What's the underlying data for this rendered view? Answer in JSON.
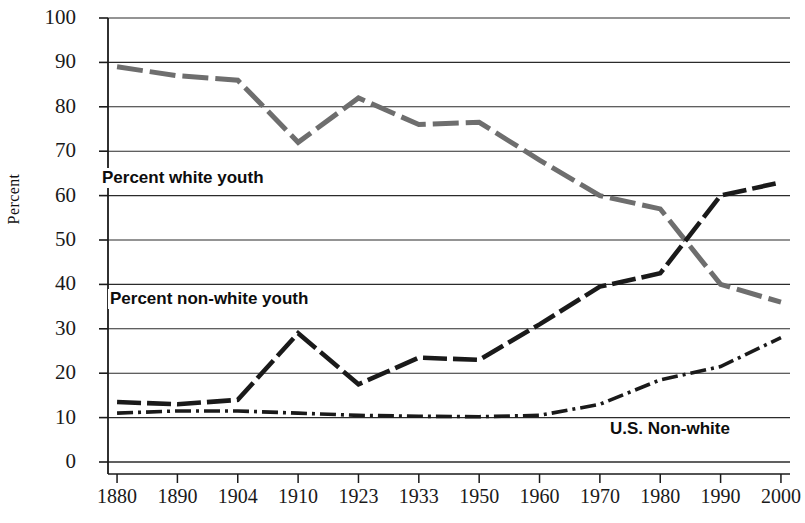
{
  "chart_data": {
    "type": "line",
    "title": "",
    "xlabel": "",
    "ylabel": "Percent",
    "ylim": [
      0,
      100
    ],
    "ytick_step": 10,
    "grid": true,
    "legend_position": "inline-annotations",
    "categories": [
      "1880",
      "1890",
      "1904",
      "1910",
      "1923",
      "1933",
      "1950",
      "1960",
      "1970",
      "1980",
      "1990",
      "2000"
    ],
    "series": [
      {
        "name": "Percent white youth",
        "color": "#6e6e6e",
        "style": "long-dash",
        "values": [
          89,
          87,
          86,
          72,
          82,
          76,
          76.5,
          68,
          60,
          57,
          40,
          36
        ]
      },
      {
        "name": "Percent non-white youth",
        "color": "#1a1a1a",
        "style": "dashed-thick",
        "values": [
          13.5,
          13,
          14,
          29,
          17.5,
          23.5,
          23,
          31,
          39.5,
          42.5,
          60,
          63
        ]
      },
      {
        "name": "U.S. Non-white",
        "color": "#1a1a1a",
        "style": "dash-dot",
        "values": [
          11,
          11.5,
          11.5,
          11,
          10.5,
          10.3,
          10.2,
          10.5,
          13,
          18.5,
          21.5,
          28
        ]
      }
    ],
    "ytick_labels": [
      "100",
      "90",
      "80",
      "70",
      "60",
      "50",
      "40",
      "30",
      "20",
      "10",
      "0"
    ],
    "annotations": [
      {
        "text": "Percent white youth",
        "x": "1890",
        "y": 65
      },
      {
        "text": "Percent non-white youth",
        "x": "1890",
        "y": 37
      },
      {
        "text": "U.S. Non-white",
        "x": "1985",
        "y": 5
      }
    ]
  },
  "axis": {
    "y_title": "Percent"
  }
}
